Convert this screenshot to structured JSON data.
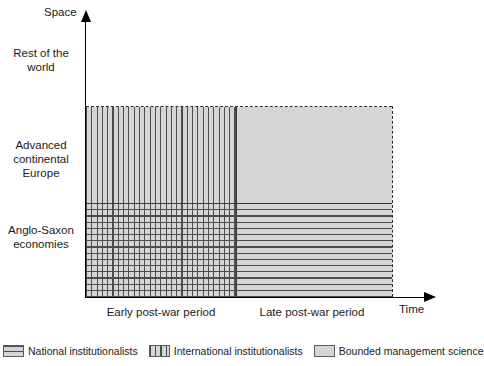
{
  "chart_data": {
    "type": "heatmap",
    "title": "",
    "xlabel": "Time",
    "ylabel": "Space",
    "x_categories": [
      "Early post-war period",
      "Late post-war period"
    ],
    "y_categories": [
      "Anglo-Saxon economies",
      "Advanced continental Europe",
      "Rest of the world"
    ],
    "grid": false,
    "legend_position": "bottom",
    "cells": [
      {
        "x": "Early post-war period",
        "y": "Advanced continental Europe",
        "fill": "vertical-stripes",
        "series": "International institutionalists"
      },
      {
        "x": "Late post-war period",
        "y": "Advanced continental Europe",
        "fill": "solid-gray",
        "series": "Bounded management science"
      },
      {
        "x": "Early post-war period",
        "y": "Anglo-Saxon economies",
        "fill": "cross-hatch",
        "series": "National institutionalists + International institutionalists"
      },
      {
        "x": "Late post-war period",
        "y": "Anglo-Saxon economies",
        "fill": "horizontal-stripes",
        "series": "National institutionalists"
      },
      {
        "x": "Early post-war period",
        "y": "Rest of the world",
        "fill": "none",
        "series": ""
      },
      {
        "x": "Late post-war period",
        "y": "Rest of the world",
        "fill": "none",
        "series": ""
      }
    ],
    "series": [
      {
        "name": "National institutionalists",
        "pattern": "horizontal-stripes"
      },
      {
        "name": "International institutionalists",
        "pattern": "vertical-stripes"
      },
      {
        "name": "Bounded management science",
        "pattern": "solid-gray"
      }
    ]
  },
  "axes": {
    "y_title": "Space",
    "x_title": "Time",
    "y_labels": [
      {
        "id": "rest-of-world",
        "text": "Rest of the world"
      },
      {
        "id": "advanced-continental-europe",
        "text": "Advanced continental Europe"
      },
      {
        "id": "anglo-saxon-economies",
        "text": "Anglo-Saxon economies"
      }
    ],
    "x_labels": [
      {
        "id": "early-post-war",
        "text": "Early post-war period"
      },
      {
        "id": "late-post-war",
        "text": "Late post-war period"
      }
    ]
  },
  "legend": {
    "items": [
      {
        "label": "National institutionalists",
        "pattern": "horizontal-stripes"
      },
      {
        "label": "International institutionalists",
        "pattern": "vertical-stripes"
      },
      {
        "label": "Bounded management science",
        "pattern": "solid-gray"
      }
    ]
  },
  "colors": {
    "fill_gray": "#d5d5d5",
    "hatch_gray": "#4d4d4d",
    "axis_black": "#000000",
    "divider_gray": "#3a3a3a"
  }
}
